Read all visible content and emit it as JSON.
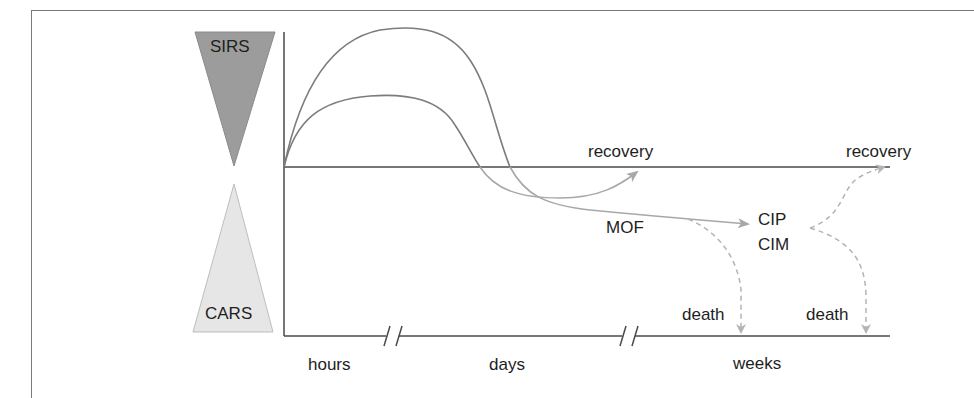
{
  "diagram": {
    "top_triangle": {
      "label": "SIRS",
      "fill": "#9c9c9c"
    },
    "bottom_triangle": {
      "label": "CARS",
      "fill": "#e6e6e6"
    },
    "outcomes": {
      "recovery_early": "recovery",
      "recovery_late": "recovery",
      "mof": "MOF",
      "cip": "CIP",
      "cim": "CIM",
      "death_1": "death",
      "death_2": "death"
    },
    "time_axis": {
      "segments": [
        "hours",
        "days",
        "weeks"
      ],
      "break_marker": "//"
    },
    "colors": {
      "axis": "#4a4a4a",
      "curve": "#7c7c7c",
      "arrow": "#a8a8a8",
      "dashed": "#b4b4b4",
      "text": "#1e1e1e"
    }
  }
}
